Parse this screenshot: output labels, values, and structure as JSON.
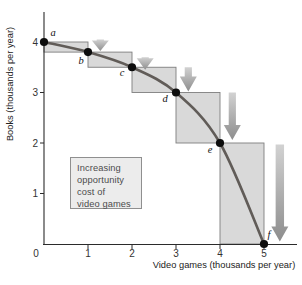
{
  "chart_data": {
    "type": "line",
    "title": "",
    "xlabel": "Video games (thousands per year)",
    "ylabel": "Books (thousands per year)",
    "xlim": [
      0,
      5.75
    ],
    "ylim": [
      0,
      4.6
    ],
    "xticks": [
      0,
      1,
      2,
      3,
      4,
      5
    ],
    "yticks": [
      1,
      2,
      3,
      4
    ],
    "origin_label": "0",
    "grid": false,
    "legend": "none",
    "series": [
      {
        "name": "production-possibilities-frontier",
        "points": [
          {
            "label": "a",
            "x": 0,
            "y": 4.0
          },
          {
            "label": "b",
            "x": 1,
            "y": 3.8
          },
          {
            "label": "c",
            "x": 2,
            "y": 3.5
          },
          {
            "label": "d",
            "x": 3,
            "y": 3.0
          },
          {
            "label": "e",
            "x": 4,
            "y": 2.0
          },
          {
            "label": "f",
            "x": 5,
            "y": 0.0
          }
        ]
      }
    ],
    "opportunity_cost_steps": [
      {
        "x0": 0,
        "x1": 1,
        "y_top": 4.0,
        "y_bottom": 3.8
      },
      {
        "x0": 1,
        "x1": 2,
        "y_top": 3.8,
        "y_bottom": 3.5
      },
      {
        "x0": 2,
        "x1": 3,
        "y_top": 3.5,
        "y_bottom": 3.0
      },
      {
        "x0": 3,
        "x1": 4,
        "y_top": 3.0,
        "y_bottom": 2.0
      },
      {
        "x0": 4,
        "x1": 5,
        "y_top": 2.0,
        "y_bottom": 0.0
      }
    ],
    "arrows": [
      {
        "x": 1.28,
        "y_from": 4.05,
        "y_to": 3.82
      },
      {
        "x": 2.3,
        "y_from": 3.7,
        "y_to": 3.45
      },
      {
        "x": 3.28,
        "y_from": 3.5,
        "y_to": 3.02
      },
      {
        "x": 4.28,
        "y_from": 3.0,
        "y_to": 2.06
      },
      {
        "x": 5.36,
        "y_from": 1.97,
        "y_to": 0.05
      }
    ],
    "annotation": {
      "lines": [
        "Increasing",
        "opportunity",
        "cost of",
        "video games"
      ]
    },
    "colors": {
      "curve": "#615c58",
      "point": "#0d0d0d",
      "step_fill": "#d9d9d9",
      "step_border": "#7e7e7e",
      "arrow_top": "#d2d2d2",
      "arrow_bottom": "#8d8d8d",
      "axis": "#2b2b2b",
      "tick_text": "#333333",
      "annotation_bg": "#ececec",
      "annotation_border": "#8f8f8f",
      "annotation_text": "#4c4c4c"
    }
  }
}
